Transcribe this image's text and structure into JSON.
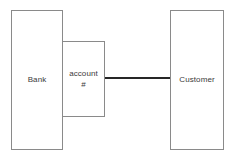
{
  "diagram": {
    "background_color": "#ffffff",
    "border_color": "#8a8a8a",
    "text_color": "#3a3a3a",
    "connector_color": "#262626",
    "nodes": [
      {
        "id": "bank",
        "label": "Bank",
        "kind": "entity"
      },
      {
        "id": "account",
        "label": "account\n#",
        "label_line_1": "account",
        "label_line_2": "#",
        "kind": "attribute"
      },
      {
        "id": "customer",
        "label": "Customer",
        "kind": "entity"
      }
    ],
    "connectors": [
      {
        "id": "account-customer",
        "from": "account",
        "to": "customer",
        "style": "solid-line"
      }
    ]
  }
}
